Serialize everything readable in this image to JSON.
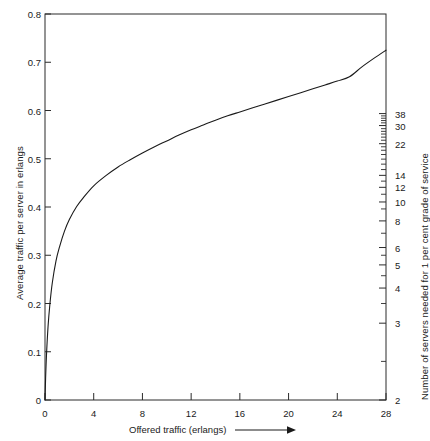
{
  "chart_data": {
    "type": "line",
    "title": "",
    "xlabel": "Offered traffic (erlangs)",
    "ylabel": "Average traffic per server in erlangs",
    "ylabel_right": "Number of servers needed for 1 per cent grade of service",
    "xlim": [
      0,
      28
    ],
    "ylim": [
      0,
      0.8
    ],
    "grid": false,
    "legend": null,
    "x_ticks": [
      0,
      4,
      8,
      12,
      16,
      20,
      24,
      28
    ],
    "y_ticks": [
      0,
      0.1,
      0.2,
      0.3,
      0.4,
      0.5,
      0.6,
      0.7,
      0.8
    ],
    "y_ticklabels": [
      "0",
      "0.1",
      "0.2",
      "0.3",
      "0.4",
      "0.5",
      "0.6",
      "0.7",
      "0.8"
    ],
    "right_axis": {
      "labeled_ticks": [
        {
          "label": "2",
          "y": 0.0
        },
        {
          "label": "3",
          "y": 0.199
        },
        {
          "label": "4",
          "y": 0.29
        },
        {
          "label": "5",
          "y": 0.35
        },
        {
          "label": "6",
          "y": 0.395
        },
        {
          "label": "8",
          "y": 0.464
        },
        {
          "label": "10",
          "y": 0.513
        },
        {
          "label": "12",
          "y": 0.551
        },
        {
          "label": "14",
          "y": 0.582
        },
        {
          "label": "22",
          "y": 0.664
        },
        {
          "label": "30",
          "y": 0.711
        },
        {
          "label": "38",
          "y": 0.742
        }
      ],
      "minor_ticks": [
        0.1,
        0.25,
        0.322,
        0.375,
        0.432,
        0.495,
        0.533,
        0.567,
        0.597,
        0.611,
        0.624,
        0.636,
        0.647,
        0.656,
        0.673,
        0.681,
        0.689,
        0.696,
        0.703,
        0.718,
        0.724,
        0.73,
        0.736
      ]
    },
    "series": [
      {
        "name": "Average traffic per server",
        "x": [
          0,
          0.05,
          0.12,
          0.25,
          0.4,
          0.6,
          0.9,
          1.2,
          1.6,
          2.0,
          2.6,
          3.2,
          4.0,
          5.0,
          6.0,
          7.0,
          8.0,
          9.0,
          10.0,
          11.0,
          12.0,
          13.0,
          14.0,
          15.0,
          16.0,
          17.0,
          18.0,
          19.0,
          20.0,
          21.0,
          22.0,
          23.0,
          24.0,
          25.0,
          26.0,
          27.0,
          28.0
        ],
        "y": [
          0.0,
          0.045,
          0.092,
          0.152,
          0.198,
          0.243,
          0.288,
          0.318,
          0.35,
          0.374,
          0.401,
          0.421,
          0.444,
          0.465,
          0.483,
          0.498,
          0.512,
          0.525,
          0.537,
          0.549,
          0.56,
          0.57,
          0.58,
          0.589,
          0.597,
          0.605,
          0.613,
          0.621,
          0.629,
          0.637,
          0.645,
          0.653,
          0.661,
          0.67,
          0.69,
          0.708,
          0.725
        ]
      }
    ]
  },
  "geometry": {
    "plot_left": 45,
    "plot_right": 386,
    "plot_top": 14,
    "plot_bottom": 400
  }
}
